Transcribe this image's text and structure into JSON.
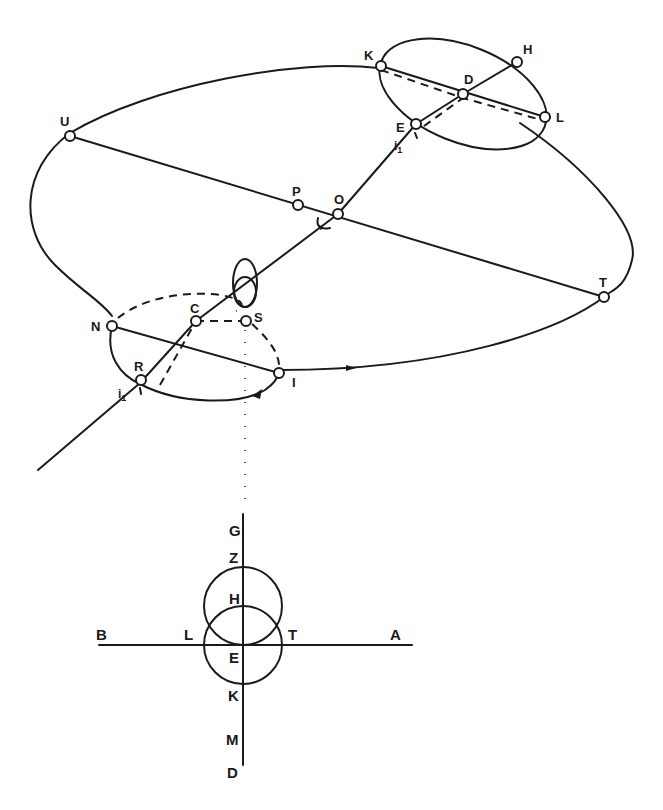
{
  "upper_figure": {
    "points": {
      "U": "U",
      "P": "P",
      "O": "O",
      "T": "T",
      "K": "K",
      "H": "H",
      "D": "D",
      "L": "L",
      "E": "E",
      "N": "N",
      "C": "C",
      "S": "S",
      "R": "R",
      "I": "I"
    },
    "angle_labels": {
      "upper": "i",
      "upper_sub": "1",
      "lower": "i",
      "lower_sub": "1"
    }
  },
  "lower_figure": {
    "labels": {
      "G": "G",
      "Z": "Z",
      "H": "H",
      "B": "B",
      "L": "L",
      "T": "T",
      "A": "A",
      "E": "E",
      "K": "K",
      "M": "M",
      "D": "D"
    }
  }
}
